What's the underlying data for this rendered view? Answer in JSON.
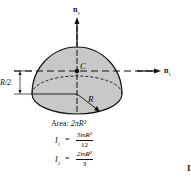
{
  "figure": {
    "axes": {
      "n1_label": "n",
      "n1_sub": "1",
      "n2_label": "n",
      "n2_sub": "2"
    },
    "labels": {
      "centroid": "C",
      "radius": "R",
      "height_dim": "R/2"
    },
    "properties": {
      "area_label": "Area:",
      "area_value": "2πR²",
      "i1_label": "I",
      "i1_sub": "1",
      "i1_eq": "=",
      "i1_num": "5mR²",
      "i1_den": "12",
      "i2_label": "I",
      "i2_sub": "2",
      "i2_eq": "=",
      "i2_num": "2mR²",
      "i2_den": "3"
    },
    "edge_fragment": "I",
    "colors": {
      "fill": "#c8c8c8",
      "stroke": "#111111",
      "background": "#ffffff"
    }
  }
}
